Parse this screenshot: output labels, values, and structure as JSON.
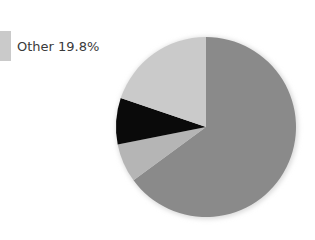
{
  "chart_data": {
    "type": "pie",
    "title": "",
    "start_angle": "12 o'clock",
    "direction": "clockwise",
    "slices": [
      {
        "name": "",
        "value": 64.9,
        "color": "#8a8a8a"
      },
      {
        "name": "",
        "value": 7.0,
        "color": "#b5b5b5"
      },
      {
        "name": "",
        "value": 8.3,
        "color": "#0a0a0a"
      },
      {
        "name": "Other",
        "value": 19.8,
        "color": "#cacaca"
      }
    ],
    "legend": {
      "position": "top-left",
      "entries": [
        {
          "label": "Other 19.8%",
          "color": "#cacaca"
        }
      ]
    }
  },
  "legend": {
    "label": "Other 19.8%",
    "color": "#cacaca"
  }
}
